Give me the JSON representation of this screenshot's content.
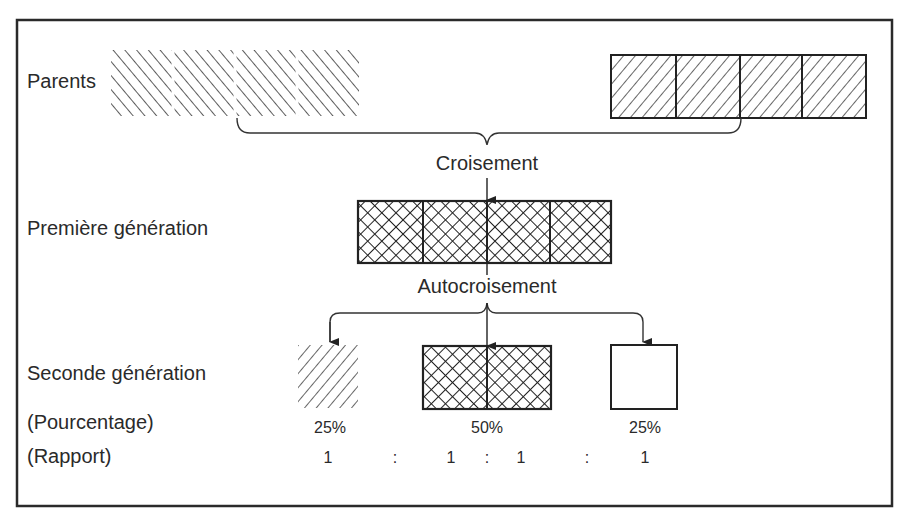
{
  "labels": {
    "parents": "Parents",
    "cross": "Croisement",
    "first_generation": "Première génération",
    "self_cross": "Autocroisement",
    "second_generation": "Seconde génération",
    "percentage": "(Pourcentage)",
    "ratio": "(Rapport)"
  },
  "parents": {
    "left": {
      "pattern": "diagonal-backslash-hatch",
      "segments": 4,
      "outlined": false
    },
    "right": {
      "pattern": "diagonal-slash-hatch",
      "segments": 4,
      "outlined": true
    }
  },
  "first_generation": {
    "pattern": "cross-hatch",
    "segments": 4
  },
  "second_generation": {
    "offspring": [
      {
        "pattern": "diagonal-slash-hatch",
        "percentage": "25%",
        "ratio": "1"
      },
      {
        "pattern": "cross-hatch",
        "percentage": "50%",
        "ratio": "1 : 1"
      },
      {
        "pattern": "empty",
        "percentage": "25%",
        "ratio": "1"
      }
    ],
    "ratio_values": [
      "1",
      ":",
      "1",
      ":",
      "1",
      ":",
      "1"
    ]
  },
  "colors": {
    "ink": "#2a2a2a",
    "background": "#ffffff"
  }
}
